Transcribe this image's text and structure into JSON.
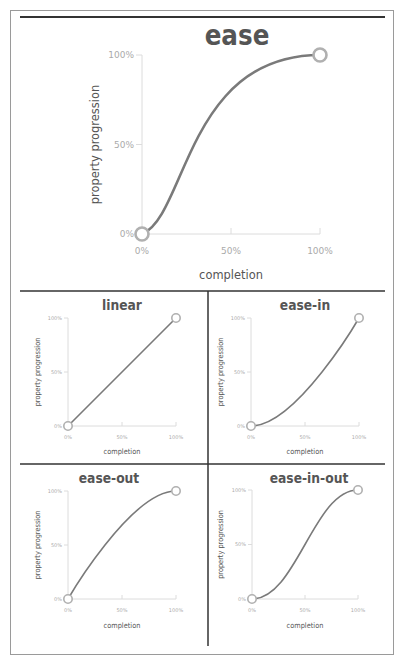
{
  "colors": {
    "curve": "#7a7a7a",
    "dot_stroke": "#b0b0b0",
    "axis": "#dcdcdc",
    "frame": "#9a9a9a",
    "divider": "#333333",
    "title": "#555555",
    "tick_label": "#aaaaaa"
  },
  "chart_data": [
    {
      "type": "line",
      "title": "ease",
      "xlabel": "completion",
      "ylabel": "property progression",
      "xticks": [
        "0%",
        "50%",
        "100%"
      ],
      "yticks": [
        "0%",
        "50%",
        "100%"
      ],
      "xlim": [
        0,
        1
      ],
      "ylim": [
        0,
        1
      ],
      "grid": false,
      "bezier": [
        0.25,
        0.1,
        0.25,
        1.0
      ],
      "start_point": [
        0,
        0
      ],
      "end_point": [
        1,
        1
      ]
    },
    {
      "type": "line",
      "title": "linear",
      "xlabel": "completion",
      "ylabel": "property progression",
      "xticks": [
        "0%",
        "50%",
        "100%"
      ],
      "yticks": [
        "0%",
        "50%",
        "100%"
      ],
      "xlim": [
        0,
        1
      ],
      "ylim": [
        0,
        1
      ],
      "grid": false,
      "bezier": [
        0.0,
        0.0,
        1.0,
        1.0
      ],
      "start_point": [
        0,
        0
      ],
      "end_point": [
        1,
        1
      ]
    },
    {
      "type": "line",
      "title": "ease-in",
      "xlabel": "completion",
      "ylabel": "property progression",
      "xticks": [
        "0%",
        "50%",
        "100%"
      ],
      "yticks": [
        "0%",
        "50%",
        "100%"
      ],
      "xlim": [
        0,
        1
      ],
      "ylim": [
        0,
        1
      ],
      "grid": false,
      "bezier": [
        0.42,
        0.0,
        1.0,
        1.0
      ],
      "start_point": [
        0,
        0
      ],
      "end_point": [
        1,
        1
      ]
    },
    {
      "type": "line",
      "title": "ease-out",
      "xlabel": "completion",
      "ylabel": "property progression",
      "xticks": [
        "0%",
        "50%",
        "100%"
      ],
      "yticks": [
        "0%",
        "50%",
        "100%"
      ],
      "xlim": [
        0,
        1
      ],
      "ylim": [
        0,
        1
      ],
      "grid": false,
      "bezier": [
        0.0,
        0.0,
        0.58,
        1.0
      ],
      "start_point": [
        0,
        0
      ],
      "end_point": [
        1,
        1
      ]
    },
    {
      "type": "line",
      "title": "ease-in-out",
      "xlabel": "completion",
      "ylabel": "property progression",
      "xticks": [
        "0%",
        "50%",
        "100%"
      ],
      "yticks": [
        "0%",
        "50%",
        "100%"
      ],
      "xlim": [
        0,
        1
      ],
      "ylim": [
        0,
        1
      ],
      "grid": false,
      "bezier": [
        0.42,
        0.0,
        0.58,
        1.0
      ],
      "start_point": [
        0,
        0
      ],
      "end_point": [
        1,
        1
      ]
    }
  ]
}
